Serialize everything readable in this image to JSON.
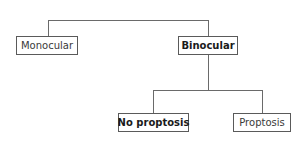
{
  "diagram": {
    "type": "decision-tree",
    "root_children": [
      {
        "id": "monocular",
        "label": "Monocular",
        "bold": false
      },
      {
        "id": "binocular",
        "label": "Binocular",
        "bold": true
      }
    ],
    "binocular_children": [
      {
        "id": "no-proptosis",
        "label": "No proptosis",
        "bold": true
      },
      {
        "id": "proptosis",
        "label": "Proptosis",
        "bold": false
      }
    ],
    "edges": [
      {
        "from": "root",
        "to": "monocular"
      },
      {
        "from": "root",
        "to": "binocular"
      },
      {
        "from": "binocular",
        "to": "no-proptosis"
      },
      {
        "from": "binocular",
        "to": "proptosis"
      }
    ],
    "colors": {
      "line": "#6a6a6a",
      "border": "#5a5a5a",
      "text": "#3a3a3a"
    }
  }
}
